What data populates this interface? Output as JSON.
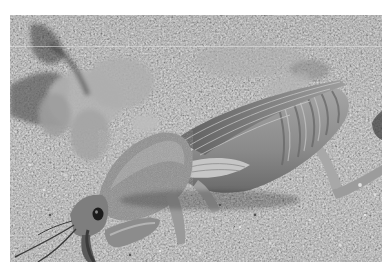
{
  "image": {
    "subject": "mole cricket on sandy ground",
    "style": "grayscale photograph",
    "alt": "A mole cricket with large digging forelegs and folded wings crawling on coarse sand, with a leafy plant in the background",
    "colors": {
      "border": "#ffffff",
      "sand_base": "#9a9a9a",
      "sand_light": "#d4d4d4",
      "sand_dark": "#5a5a5a",
      "cricket_body": "#8c8c8c",
      "cricket_highlight": "#c2c2c2",
      "cricket_shadow": "#4a4a4a",
      "plant": "#a8a8a8",
      "plant_dark": "#3c3c3c",
      "scan_line": "#e6e6e6"
    },
    "regions": {
      "photo": {
        "x": 10,
        "y": 15,
        "width": 372,
        "height": 247
      },
      "scan_line_y": 46
    }
  }
}
